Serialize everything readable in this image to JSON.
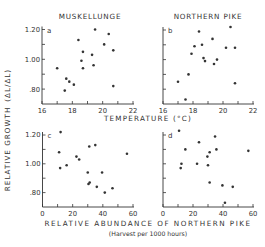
{
  "figure": {
    "ylabel": "RELATIVE GROWTH (ΔL/ΔL̂)",
    "ylabel_main": "RELATIVE GROWTH",
    "ylabel_paren": "(ΔL/ΔL)",
    "xlabel_top": "TEMPERATURE (°C)",
    "xlabel_bottom": "RELATIVE ABUNDANCE OF NORTHERN PIKE",
    "xlabel_bottom_sub": "(Harvest per 1000 hours)",
    "col_titles": [
      "MUSKELLUNGE",
      "NORTHERN PIKE"
    ],
    "ink_color": "#333333"
  },
  "chart_data": [
    {
      "panel": "a",
      "type": "scatter",
      "title": "MUSKELLUNGE",
      "xlabel": "TEMPERATURE (°C)",
      "ylabel": "RELATIVE GROWTH (ΔL/ΔL̂)",
      "xlim": [
        16,
        22
      ],
      "ylim": [
        0.7,
        1.2
      ],
      "xticks": [
        16,
        18,
        20,
        22
      ],
      "yticks": [
        0.8,
        1.0,
        1.2
      ],
      "ytick_labels": [
        ".80",
        "1.00",
        "1.20"
      ],
      "grid": false,
      "points": [
        [
          19.5,
          1.2
        ],
        [
          20.4,
          1.17
        ],
        [
          18.4,
          1.13
        ],
        [
          20.1,
          1.1
        ],
        [
          18.7,
          1.05
        ],
        [
          20.7,
          1.06
        ],
        [
          19.3,
          1.03
        ],
        [
          18.6,
          0.99
        ],
        [
          19.4,
          0.96
        ],
        [
          18.7,
          0.94
        ],
        [
          17.0,
          0.94
        ],
        [
          17.6,
          0.87
        ],
        [
          17.8,
          0.85
        ],
        [
          18.1,
          0.83
        ],
        [
          17.5,
          0.79
        ],
        [
          20.7,
          0.82
        ]
      ]
    },
    {
      "panel": "b",
      "type": "scatter",
      "title": "NORTHERN PIKE",
      "xlabel": "TEMPERATURE (°C)",
      "xlim": [
        16,
        22
      ],
      "ylim": [
        0.7,
        1.2
      ],
      "xticks": [
        16,
        18,
        20,
        22
      ],
      "yticks": [
        0.8,
        1.0,
        1.2
      ],
      "grid": false,
      "points": [
        [
          20.5,
          1.22
        ],
        [
          18.4,
          1.19
        ],
        [
          19.3,
          1.14
        ],
        [
          20.2,
          1.08
        ],
        [
          20.8,
          1.08
        ],
        [
          18.6,
          1.1
        ],
        [
          18.1,
          1.09
        ],
        [
          17.9,
          1.04
        ],
        [
          18.7,
          1.01
        ],
        [
          19.6,
          1.0
        ],
        [
          18.8,
          0.99
        ],
        [
          19.4,
          0.97
        ],
        [
          17.7,
          0.9
        ],
        [
          17.0,
          0.85
        ],
        [
          20.8,
          0.84
        ],
        [
          17.5,
          0.73
        ]
      ]
    },
    {
      "panel": "c",
      "type": "scatter",
      "xlabel": "RELATIVE ABUNDANCE OF NORTHERN PIKE (Harvest per 1000 hours)",
      "ylabel": "RELATIVE GROWTH (ΔL/ΔL̂)",
      "xlim": [
        0,
        60
      ],
      "ylim": [
        0.7,
        1.2
      ],
      "xticks": [
        0,
        20,
        40,
        60
      ],
      "yticks": [
        0.8,
        1.0,
        1.2
      ],
      "ytick_labels": [
        ".80",
        "1.00",
        "1.20"
      ],
      "grid": false,
      "points": [
        [
          12,
          1.22
        ],
        [
          11,
          1.08
        ],
        [
          22.5,
          1.05
        ],
        [
          24.3,
          1.03
        ],
        [
          31,
          1.12
        ],
        [
          35,
          1.13
        ],
        [
          56,
          1.07
        ],
        [
          11.7,
          0.97
        ],
        [
          16,
          0.99
        ],
        [
          30,
          0.94
        ],
        [
          39.5,
          0.94
        ],
        [
          31.3,
          0.87
        ],
        [
          30.5,
          0.86
        ],
        [
          36,
          0.84
        ],
        [
          46.4,
          0.83
        ],
        [
          41.3,
          0.8
        ]
      ]
    },
    {
      "panel": "d",
      "type": "scatter",
      "xlabel": "RELATIVE ABUNDANCE OF NORTHERN PIKE (Harvest per 1000 hours)",
      "xlim": [
        0,
        60
      ],
      "ylim": [
        0.7,
        1.2
      ],
      "xticks": [
        0,
        20,
        40,
        60
      ],
      "yticks": [
        0.8,
        1.0,
        1.2
      ],
      "grid": false,
      "points": [
        [
          10.7,
          1.23
        ],
        [
          34.7,
          1.19
        ],
        [
          24,
          1.15
        ],
        [
          14.9,
          1.1
        ],
        [
          31.1,
          1.08
        ],
        [
          35.6,
          1.1
        ],
        [
          56.9,
          1.09
        ],
        [
          29.6,
          1.05
        ],
        [
          12.3,
          1.0
        ],
        [
          22.7,
          1.0
        ],
        [
          11.8,
          0.97
        ],
        [
          30,
          0.99
        ],
        [
          31.1,
          0.87
        ],
        [
          39.6,
          0.85
        ],
        [
          46.5,
          0.84
        ],
        [
          41.3,
          0.73
        ]
      ]
    }
  ]
}
